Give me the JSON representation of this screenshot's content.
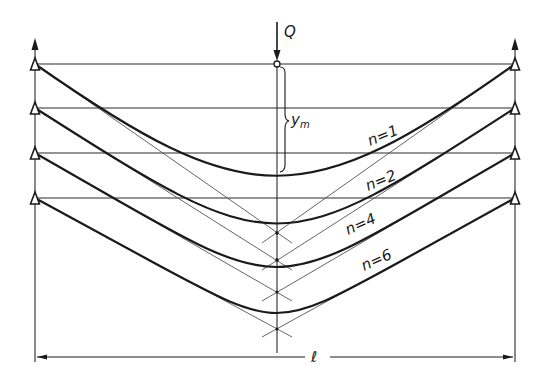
{
  "figure": {
    "type": "structural-diagram",
    "load": {
      "label": "Q",
      "x": 277,
      "arrow_top": 22,
      "node_y": 64
    },
    "sag": {
      "label": "y",
      "subscript": "m"
    },
    "span": {
      "label": "ℓ",
      "y": 357,
      "x_left": 35,
      "x_right": 515
    },
    "supports": {
      "left_x": 35,
      "right_x": 515,
      "levels_y": [
        64,
        108,
        153,
        198
      ]
    },
    "center_x": 277,
    "curves": [
      {
        "label": "n=1",
        "n": 1,
        "support_y": 64,
        "tangent_intersection_y": 233,
        "bottom_y": 176
      },
      {
        "label": "n=2",
        "n": 2,
        "support_y": 108,
        "tangent_intersection_y": 260,
        "bottom_y": 221
      },
      {
        "label": "n=4",
        "n": 4,
        "support_y": 153,
        "tangent_intersection_y": 292,
        "bottom_y": 267
      },
      {
        "label": "n=6",
        "n": 6,
        "support_y": 198,
        "tangent_intersection_y": 329,
        "bottom_y": 313
      }
    ]
  },
  "labels": {
    "load": "Q",
    "sag_main": "y",
    "sag_sub": "m",
    "span": "ℓ",
    "n1": "n=1",
    "n2": "n=2",
    "n4": "n=4",
    "n6": "n=6"
  }
}
